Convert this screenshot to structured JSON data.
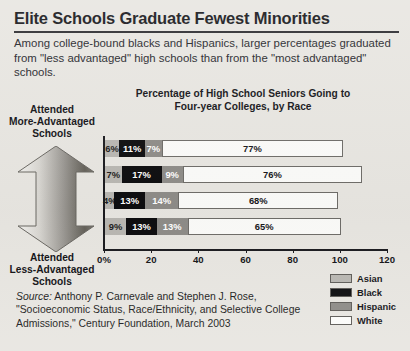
{
  "headline": "Elite Schools Graduate Fewest Minorities",
  "deck": "Among college-bound blacks and Hispanics, larger percentages graduated from \"less advantaged\" high schools than from the \"most advantaged\" schools.",
  "axis_side": {
    "top_label": "Attended\nMore-Advantaged\nSchools",
    "top_line1": "Attended",
    "top_line2": "More-Advantaged",
    "top_line3": "Schools",
    "bottom_line1": "Attended",
    "bottom_line2": "Less-Advantaged",
    "bottom_line3": "Schools",
    "arrow_name": "double-headed-vertical-arrow"
  },
  "source": {
    "label": "Source:",
    "text": " Anthony P. Carnevale and Stephen J. Rose, \"Socioeconomic Status, Race/Ethnicity, and Selective College Admissions,\" Century Foundation, March 2003"
  },
  "colors": {
    "asian": "#b9b7b2",
    "black": "#0d0d0f",
    "hispanic": "#8e8c88",
    "white": "#fbfbf9",
    "background": "#e8e6e1",
    "axis": "#1b1b1f"
  },
  "chart_data": {
    "type": "bar",
    "orientation": "horizontal",
    "stacked": true,
    "title": "Percentage of High School Seniors Going to Four-year Colleges, by Race",
    "title_line1": "Percentage of High School Seniors Going to",
    "title_line2": "Four-year Colleges, by Race",
    "xlabel": "",
    "ylabel": "",
    "xlim": [
      0,
      120
    ],
    "xticks": [
      0,
      20,
      40,
      60,
      80,
      100,
      120
    ],
    "xtick_labels": [
      "0%",
      "20",
      "40",
      "60",
      "80",
      "100",
      "120"
    ],
    "grid": false,
    "legend_position": "bottom-right",
    "categories": [
      "More-advantaged schools (top tier)",
      "Tier 2",
      "Tier 3",
      "Less-advantaged schools (bottom tier)"
    ],
    "series": [
      {
        "name": "Asian",
        "color": "#b9b7b2",
        "values": [
          6,
          7,
          4,
          9
        ],
        "labels": [
          "6%",
          "7%",
          "4%",
          "9%"
        ]
      },
      {
        "name": "Black",
        "color": "#0d0d0f",
        "values": [
          11,
          17,
          13,
          13
        ],
        "labels": [
          "11%",
          "17%",
          "13%",
          "13%"
        ]
      },
      {
        "name": "Hispanic",
        "color": "#8e8c88",
        "values": [
          7,
          9,
          14,
          13
        ],
        "labels": [
          "7%",
          "9%",
          "14%",
          "13%"
        ]
      },
      {
        "name": "White",
        "color": "#fbfbf9",
        "values": [
          77,
          76,
          68,
          65
        ],
        "labels": [
          "77%",
          "76%",
          "68%",
          "65%"
        ]
      }
    ],
    "legend": [
      "Asian",
      "Black",
      "Hispanic",
      "White"
    ]
  }
}
